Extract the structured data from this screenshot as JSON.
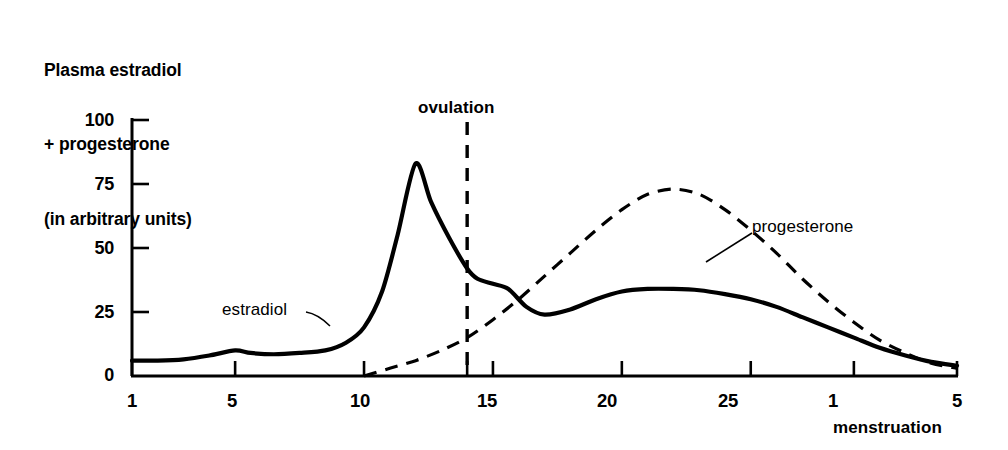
{
  "chart_data": {
    "type": "line",
    "title": "Plasma estradiol + progesterone (in arbitrary units)",
    "title_lines": [
      "Plasma estradiol",
      "+ progesterone",
      "(in arbitrary units)"
    ],
    "xlabel": "menstruation",
    "ylabel": "Plasma estradiol + progesterone (in arbitrary units)",
    "ylim": [
      0,
      100
    ],
    "xlim": [
      1,
      33
    ],
    "grid": false,
    "legend": "inline-annotations",
    "yticks": [
      0,
      25,
      50,
      75,
      100
    ],
    "ytick_labels": [
      "0",
      "25",
      "50",
      "75",
      "100"
    ],
    "xticks": [
      1,
      5,
      10,
      14,
      15,
      20,
      25,
      29,
      33
    ],
    "xtick_labels": [
      "1",
      "5",
      "10",
      "",
      "15",
      "20",
      "25",
      "1",
      "5"
    ],
    "annotations": [
      {
        "name": "ovulation",
        "text": "ovulation",
        "x": 14,
        "style": "dashed-vertical-line"
      },
      {
        "name": "estradiol",
        "text": "estradiol",
        "x": 6.5,
        "y": 27,
        "style": "leader-line"
      },
      {
        "name": "progesterone",
        "text": "progesterone",
        "x": 26.5,
        "y": 52,
        "style": "leader-line"
      },
      {
        "name": "menstruation",
        "text": "menstruation",
        "x": 29,
        "style": "axis-caption"
      }
    ],
    "series": [
      {
        "name": "estradiol",
        "line_style": "solid",
        "color": "#000000",
        "x": [
          1,
          2,
          3,
          4,
          5,
          5.6,
          6.5,
          7.5,
          8.5,
          9.3,
          10,
          10.7,
          11.3,
          12,
          12.6,
          13.3,
          14,
          14.4,
          15,
          15.6,
          16.3,
          17,
          18,
          19,
          20,
          21,
          22,
          23,
          24,
          25,
          26,
          27,
          28,
          29,
          30,
          31,
          32,
          33
        ],
        "y": [
          6,
          6,
          6.5,
          8,
          10,
          9,
          8.5,
          9,
          10,
          13,
          19,
          33,
          55,
          83,
          68,
          54,
          42,
          38,
          36,
          34,
          27,
          24,
          26,
          30,
          33,
          34,
          34,
          33.5,
          32,
          30,
          27,
          23,
          19,
          15,
          11,
          8,
          5.5,
          4
        ]
      },
      {
        "name": "progesterone",
        "line_style": "dashed",
        "color": "#000000",
        "x": [
          10,
          11,
          12,
          13,
          14,
          15,
          16,
          17,
          18,
          19,
          20,
          21,
          22,
          23,
          24,
          25,
          26,
          27,
          28,
          29,
          30,
          31,
          32,
          33
        ],
        "y": [
          0,
          3,
          6,
          10,
          15,
          22,
          30,
          39,
          48,
          57,
          65,
          71,
          73,
          71,
          65,
          57,
          48,
          38,
          29,
          21,
          14,
          9,
          5,
          3
        ]
      }
    ]
  },
  "chart_title_lines": {
    "line1": "Plasma estradiol",
    "line2": "+ progesterone",
    "line3": "(in arbitrary units)"
  },
  "labels": {
    "ovulation": "ovulation",
    "estradiol": "estradiol",
    "progesterone": "progesterone",
    "menstruation": "menstruation"
  },
  "yticks": {
    "t0": "0",
    "t1": "25",
    "t2": "50",
    "t3": "75",
    "t4": "100"
  },
  "xticks": {
    "t0": "1",
    "t1": "5",
    "t2": "10",
    "t3": "15",
    "t4": "20",
    "t5": "25",
    "t6": "1",
    "t7": "5"
  },
  "colors": {
    "ink": "#000000",
    "background": "#ffffff"
  }
}
